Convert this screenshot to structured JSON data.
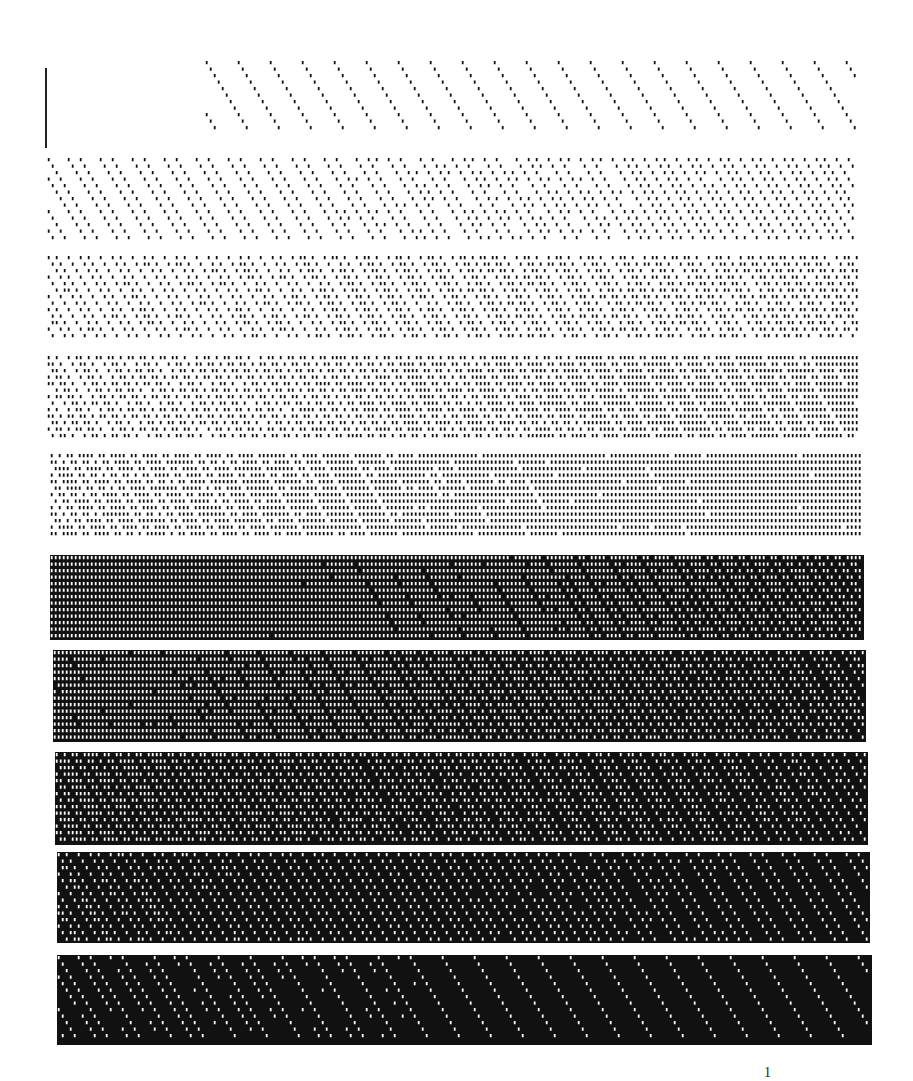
{
  "page": {
    "background": "#ffffff",
    "ink": "#111111",
    "page_number": "1"
  },
  "marker": {
    "name": "registration-line"
  },
  "bands": [
    {
      "index": 1,
      "level": 0.04,
      "x": 205,
      "y": 60,
      "w": 653,
      "h": 75,
      "style": "sparse-dots"
    },
    {
      "index": 2,
      "level": 0.12,
      "x": 47,
      "y": 157,
      "w": 811,
      "h": 86,
      "style": "dots"
    },
    {
      "index": 3,
      "level": 0.22,
      "x": 47,
      "y": 255,
      "w": 813,
      "h": 85,
      "style": "dots-dense"
    },
    {
      "index": 4,
      "level": 0.32,
      "x": 47,
      "y": 355,
      "w": 814,
      "h": 85,
      "style": "zigzag"
    },
    {
      "index": 5,
      "level": 0.42,
      "x": 50,
      "y": 453,
      "w": 812,
      "h": 87,
      "style": "lattice-white-holes"
    },
    {
      "index": 6,
      "level": 0.52,
      "x": 50,
      "y": 555,
      "w": 814,
      "h": 85,
      "style": "checker-black-dots"
    },
    {
      "index": 7,
      "level": 0.62,
      "x": 53,
      "y": 650,
      "w": 813,
      "h": 92,
      "style": "checker-dense"
    },
    {
      "index": 8,
      "level": 0.72,
      "x": 55,
      "y": 752,
      "w": 813,
      "h": 93,
      "style": "dark-zigzag"
    },
    {
      "index": 9,
      "level": 0.84,
      "x": 57,
      "y": 852,
      "w": 813,
      "h": 91,
      "style": "dark-holes"
    },
    {
      "index": 10,
      "level": 0.94,
      "x": 57,
      "y": 955,
      "w": 815,
      "h": 90,
      "style": "near-black-sparse-holes"
    }
  ]
}
